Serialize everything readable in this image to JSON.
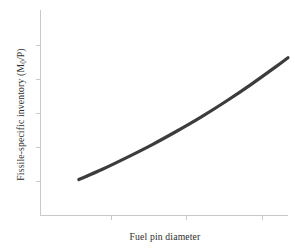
{
  "chart_data": {
    "type": "line",
    "title": "",
    "subtitle": "",
    "xlabel": "Fuel pin diameter",
    "ylabel_text": "Fissile-specific inventory (M",
    "ylabel_sub": "0",
    "ylabel_tail": "/P)",
    "ylabel_full": "Fissile-specific inventory (M0/P)",
    "legend": [],
    "legend_position": "none",
    "grid": false,
    "xlim": [
      0,
      1
    ],
    "ylim": [
      0,
      1
    ],
    "x_tick_labels": [],
    "y_tick_labels": [],
    "x_ticks_normalized": [
      0.32,
      0.66,
      1.0
    ],
    "y_ticks_normalized": [
      0.17,
      0.33,
      0.5,
      0.67,
      0.83,
      1.0
    ],
    "series": [
      {
        "name": "Fissile-specific inventory vs fuel pin diameter",
        "color": "#3c3c3c",
        "line_width": 3.2,
        "x": [
          0.155,
          0.25,
          0.35,
          0.45,
          0.55,
          0.65,
          0.75,
          0.85,
          0.95,
          1.0
        ],
        "y": [
          0.175,
          0.225,
          0.283,
          0.344,
          0.41,
          0.48,
          0.556,
          0.637,
          0.723,
          0.768
        ]
      }
    ]
  },
  "style": {
    "background": "#ffffff",
    "axis_color": "#c9c9c9",
    "curve_color": "#3c3c3c",
    "text_color": "#2d2d2d"
  },
  "icons": {
    "chart_icon": "line-chart-icon"
  }
}
